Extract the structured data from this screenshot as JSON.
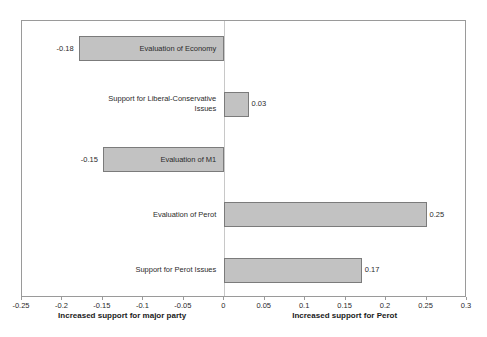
{
  "chart_data": {
    "type": "bar",
    "orientation": "horizontal",
    "title": "",
    "subtitle": "",
    "xlabel_left": "Increased support for major party",
    "xlabel_right": "Increased support for Perot",
    "ylabel": "",
    "xlim": [
      -0.25,
      0.3
    ],
    "xticks": [
      -0.25,
      -0.2,
      -0.15,
      -0.1,
      -0.05,
      0,
      0.05,
      0.1,
      0.15,
      0.2,
      0.25,
      0.3
    ],
    "xtick_labels": [
      "-0.25",
      "-0.2",
      "-0.15",
      "-0.1",
      "-0.05",
      "0",
      "0.05",
      "0.1",
      "0.15",
      "0.2",
      "0.25",
      "0.3"
    ],
    "grid": false,
    "legend": null,
    "zero_reference_line": 0,
    "categories": [
      "Evaluation of Economy",
      "Support for Liberal-Conservative Issues",
      "Evaluation of M1",
      "Evaluation of Perot",
      "Support for Perot Issues"
    ],
    "values": [
      -0.18,
      0.03,
      -0.15,
      0.25,
      0.17
    ],
    "value_labels": [
      "-0.18",
      "0.03",
      "-0.15",
      "0.25",
      "0.17"
    ],
    "bars": [
      {
        "category": "Evaluation of Economy",
        "value": -0.18,
        "value_label": "-0.18",
        "label_wraps": false
      },
      {
        "category": "Support for Liberal-Conservative Issues",
        "value": 0.03,
        "value_label": "0.03",
        "label_wraps": true,
        "line1": "Support for Liberal-Conservative",
        "line2": "Issues"
      },
      {
        "category": "Evaluation of M1",
        "value": -0.15,
        "value_label": "-0.15",
        "label_wraps": false
      },
      {
        "category": "Evaluation of Perot",
        "value": 0.25,
        "value_label": "0.25",
        "label_wraps": false
      },
      {
        "category": "Support for Perot Issues",
        "value": 0.17,
        "value_label": "0.17",
        "label_wraps": false
      }
    ],
    "colors": {
      "bar_fill": "#c2c2c2",
      "bar_border": "#7b7b7b",
      "frame": "#9a9a9a",
      "zero_line": "#c8c8c8",
      "text": "#2b2b2b",
      "background": "#ffffff"
    }
  }
}
